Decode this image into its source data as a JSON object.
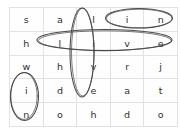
{
  "puzzle": {
    "type": "word-search",
    "rows": 5,
    "cols": 5,
    "grid": [
      [
        "s",
        "a",
        "l",
        "i",
        "n"
      ],
      [
        "h",
        "l",
        "i",
        "v",
        "e"
      ],
      [
        "w",
        "h",
        "v",
        "r",
        "j"
      ],
      [
        "i",
        "d",
        "e",
        "a",
        "t"
      ],
      [
        "n",
        "o",
        "h",
        "d",
        "o"
      ]
    ],
    "cells": {
      "r0c0": "s",
      "r0c1": "a",
      "r0c2": "l",
      "r0c3": "i",
      "r0c4": "n",
      "r1c0": "h",
      "r1c1": "l",
      "r1c2": "i",
      "r1c3": "v",
      "r1c4": "e",
      "r2c0": "w",
      "r2c1": "h",
      "r2c2": "v",
      "r2c3": "r",
      "r2c4": "j",
      "r3c0": "i",
      "r3c1": "d",
      "r3c2": "e",
      "r3c3": "a",
      "r3c4": "t",
      "r4c0": "n",
      "r4c1": "o",
      "r4c2": "h",
      "r4c3": "d",
      "r4c4": "o"
    },
    "circled_words": [
      {
        "word": "in",
        "orientation": "horizontal",
        "start": [
          0,
          3
        ],
        "end": [
          0,
          4
        ],
        "letters": [
          "i",
          "n"
        ]
      },
      {
        "word": "live",
        "orientation": "horizontal",
        "start": [
          1,
          1
        ],
        "end": [
          1,
          4
        ],
        "letters": [
          "l",
          "i",
          "v",
          "e"
        ]
      },
      {
        "word": "live",
        "orientation": "vertical",
        "start": [
          0,
          2
        ],
        "end": [
          3,
          2
        ],
        "letters": [
          "l",
          "i",
          "v",
          "e"
        ]
      },
      {
        "word": "in",
        "orientation": "vertical",
        "start": [
          3,
          0
        ],
        "end": [
          4,
          0
        ],
        "letters": [
          "i",
          "n"
        ]
      }
    ],
    "colors": {
      "ink": "#2e2e30",
      "mark_stroke": "#4a4a4e",
      "grid_line": "#e2e2e4",
      "background": "#ffffff"
    }
  }
}
